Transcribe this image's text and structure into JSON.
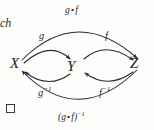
{
  "figure": {
    "kind": "commutative-diagram",
    "background_color": "#fdfdfc",
    "ink_color": "#2a2a2a"
  },
  "nodes": [
    {
      "id": "X",
      "label": "X",
      "x": 17,
      "y": 63
    },
    {
      "id": "Y",
      "label": "Y",
      "x": 73,
      "y": 66
    },
    {
      "id": "Z",
      "label": "Z",
      "x": 137,
      "y": 63
    }
  ],
  "arrows": [
    {
      "id": "g",
      "from": "X",
      "to": "Y",
      "label": "g",
      "label_x": 39,
      "label_y": 31,
      "direction": "left-to-right",
      "curve": "arc-above"
    },
    {
      "id": "f",
      "from": "Y",
      "to": "Z",
      "label": "f",
      "label_x": 105,
      "label_y": 31,
      "direction": "left-to-right",
      "curve": "arc-above"
    },
    {
      "id": "gof",
      "from": "X",
      "to": "Z",
      "label_parts": {
        "left": "g",
        "op": "∘",
        "right": "f"
      },
      "label_plain": "g∘f",
      "label_x": 65,
      "label_y": 6,
      "direction": "left-to-right",
      "curve": "outer-arc-above"
    },
    {
      "id": "g-inverse",
      "from": "Y",
      "to": "X",
      "label_base": "g",
      "label_sup": "−1",
      "label_plain": "g⁻¹",
      "label_x": 38,
      "label_y": 86,
      "direction": "right-to-left",
      "curve": "arc-below"
    },
    {
      "id": "f-inverse",
      "from": "Z",
      "to": "Y",
      "label_base": "f",
      "label_sup": "−1",
      "label_plain": "f⁻¹",
      "label_x": 99,
      "label_y": 86,
      "direction": "right-to-left",
      "curve": "arc-below"
    },
    {
      "id": "gof-inverse",
      "from": "Z",
      "to": "X",
      "label_parts": {
        "open": "(",
        "left": "g",
        "op": "∘",
        "right": "f",
        "close": ")",
        "sup": "−1"
      },
      "label_plain": "(g∘f)⁻¹",
      "label_x": 58,
      "label_y": 111,
      "direction": "right-to-left",
      "curve": "outer-arc-below"
    }
  ],
  "page_text": {
    "fragment": "ch",
    "fragment_x": 0,
    "fragment_y": 17
  },
  "qed": {
    "symbol": "□",
    "x": 6,
    "y": 104,
    "size": 9
  }
}
